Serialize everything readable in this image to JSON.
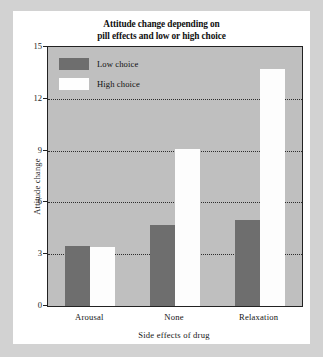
{
  "chart_data": {
    "type": "bar",
    "title": "Attitude change depending on pill effects and low or high choice",
    "title_line1": "Attitude change depending on",
    "title_line2": "pill effects and low or high choice",
    "xlabel": "Side effects of drug",
    "ylabel": "Attitude change",
    "categories": [
      "Arousal",
      "None",
      "Relaxation"
    ],
    "series": [
      {
        "name": "Low choice",
        "color": "#6e6e6e",
        "values": [
          3.5,
          4.7,
          5.0
        ]
      },
      {
        "name": "High choice",
        "color": "#ffffff",
        "values": [
          3.4,
          9.1,
          13.7
        ]
      }
    ],
    "ylim": [
      0,
      15
    ],
    "yticks": [
      0,
      3,
      6,
      9,
      12,
      15
    ],
    "ytick_labels": [
      "0",
      "3",
      "6",
      "9",
      "12",
      "15"
    ],
    "grid": true,
    "grid_style": "dotted",
    "legend_position": "top-left-inside",
    "plot_background": "#bfbfbf",
    "page_background": "#d2d2d2",
    "card_background": "#ffffff",
    "axis_color": "#222222"
  }
}
